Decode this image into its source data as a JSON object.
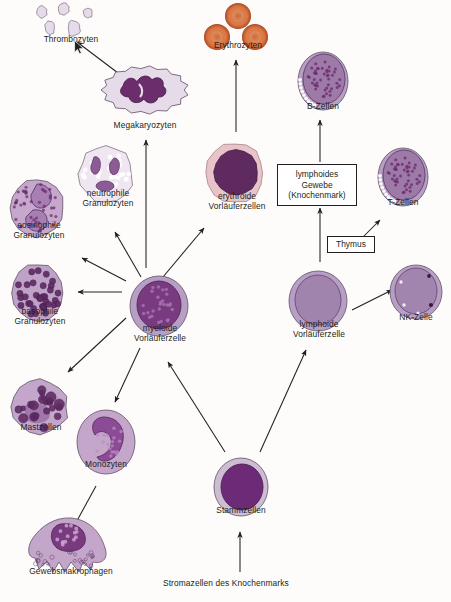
{
  "diagram": {
    "background_color": "#fdfcfa",
    "text_color": "#231f20",
    "arrow_color": "#231f20",
    "palette": {
      "erythrocyte": "#d9713d",
      "erythrocyte_dark": "#b0522a",
      "lymph_cytoplasm": "#b79ec4",
      "nucleus_dark": "#6b2d6b",
      "nucleus_mid": "#8c5b96",
      "pale_cytoplasm": "#e6dbe8",
      "pink_cytoplasm": "#e8c3c8",
      "stem_nucleus": "#6d2b77"
    },
    "nodes": [
      {
        "id": "thrombozyten",
        "label": "Thrombozyten",
        "kind": "platelets",
        "x": 28,
        "y": 2,
        "w": 86,
        "h": 44,
        "label_y": 32
      },
      {
        "id": "erythrozyten",
        "label": "Erythrozyten",
        "kind": "erythrocytes",
        "x": 193,
        "y": 2,
        "w": 90,
        "h": 50,
        "label_y": 38
      },
      {
        "id": "megakaryozyten",
        "label": "Megakaryozyten",
        "kind": "megakaryocyte",
        "x": 99,
        "y": 64,
        "w": 92,
        "h": 70,
        "label_y": 56
      },
      {
        "id": "b-zellen",
        "label": "B-Zellen",
        "kind": "lymphocyte-speckled",
        "x": 292,
        "y": 47,
        "w": 62,
        "h": 70,
        "label_y": 54
      },
      {
        "id": "neutrophile-granulozyten",
        "label": "neutrophile\nGranulozyten",
        "kind": "neutrophil",
        "x": 72,
        "y": 140,
        "w": 72,
        "h": 74,
        "label_y": 48
      },
      {
        "id": "erythroide-vorlaeuferzellen",
        "label": "erythroide\nVorläuferzellen",
        "kind": "erythroid-precursor",
        "x": 199,
        "y": 135,
        "w": 76,
        "h": 80,
        "label_y": 56
      },
      {
        "id": "t-zellen",
        "label": "T-Zellen",
        "kind": "lymphocyte-speckled",
        "x": 372,
        "y": 143,
        "w": 62,
        "h": 70,
        "label_y": 54
      },
      {
        "id": "eosinophile-granulozyten",
        "label": "eosinophile\nGranulozyten",
        "kind": "eosinophil",
        "x": 3,
        "y": 172,
        "w": 72,
        "h": 76,
        "label_y": 48
      },
      {
        "id": "basophile-granulozyten",
        "label": "basophile\nGranulozyten",
        "kind": "basophil",
        "x": 5,
        "y": 258,
        "w": 70,
        "h": 76,
        "label_y": 48
      },
      {
        "id": "myeloide-vorlaeuferzelle",
        "label": "myeloide\nVorläuferzelle",
        "kind": "progenitor",
        "x": 124,
        "y": 271,
        "w": 72,
        "h": 76,
        "label_y": 52
      },
      {
        "id": "lymphoide-vorlaeuferzelle",
        "label": "lymphoide\nVorläuferzelle",
        "kind": "progenitor-light",
        "x": 283,
        "y": 265,
        "w": 72,
        "h": 78,
        "label_y": 54
      },
      {
        "id": "nk-zelle",
        "label": "NK-Zelle",
        "kind": "nk-cell",
        "x": 385,
        "y": 258,
        "w": 62,
        "h": 70,
        "label_y": 54
      },
      {
        "id": "mastzellen",
        "label": "Mastzellen",
        "kind": "mast-cell",
        "x": 6,
        "y": 374,
        "w": 70,
        "h": 70,
        "label_y": 48
      },
      {
        "id": "monozyten",
        "label": "Monozyten",
        "kind": "monocyte",
        "x": 73,
        "y": 405,
        "w": 66,
        "h": 76,
        "label_y": 54
      },
      {
        "id": "stammzellen",
        "label": "Stammzellen",
        "kind": "stem-cell",
        "x": 208,
        "y": 451,
        "w": 66,
        "h": 76,
        "label_y": 54
      },
      {
        "id": "gewebsmakrophagen",
        "label": "Gewebsmakrophagen",
        "kind": "macrophage",
        "x": 21,
        "y": 512,
        "w": 100,
        "h": 72,
        "label_y": 54
      }
    ],
    "boxes": [
      {
        "id": "lymphoides-gewebe",
        "label": "lymphoides\nGewebe\n(Knochenmark)",
        "x": 277,
        "y": 164,
        "w": 80,
        "h": 42
      },
      {
        "id": "thymus",
        "label": "Thymus",
        "x": 327,
        "y": 236,
        "w": 48,
        "h": 17
      }
    ],
    "caption": {
      "id": "stromazellen",
      "label": "Stromazellen des Knochenmarks",
      "x": 163,
      "y": 578
    },
    "arrows": [
      {
        "id": "megakaryozyten-to-thrombozyten",
        "x1": 122,
        "y1": 76,
        "x2": 77,
        "y2": 42
      },
      {
        "id": "myeloid-to-megakaryozyten",
        "x1": 146,
        "y1": 268,
        "x2": 146,
        "y2": 140
      },
      {
        "id": "erythroid-to-erythrozyten",
        "x1": 236,
        "y1": 132,
        "x2": 236,
        "y2": 60
      },
      {
        "id": "lymphgewebe-to-bzellen",
        "x1": 320,
        "y1": 162,
        "x2": 320,
        "y2": 120
      },
      {
        "id": "lymphoid-to-lymphgewebe",
        "x1": 320,
        "y1": 262,
        "x2": 320,
        "y2": 208
      },
      {
        "id": "myeloid-to-neutrophil",
        "x1": 141,
        "y1": 277,
        "x2": 115,
        "y2": 232
      },
      {
        "id": "myeloid-to-eosinophil",
        "x1": 126,
        "y1": 281,
        "x2": 82,
        "y2": 258
      },
      {
        "id": "myeloid-to-basophil",
        "x1": 122,
        "y1": 292,
        "x2": 78,
        "y2": 292
      },
      {
        "id": "myeloid-to-erythroid",
        "x1": 163,
        "y1": 277,
        "x2": 204,
        "y2": 228
      },
      {
        "id": "myeloid-to-mastzellen",
        "x1": 126,
        "y1": 318,
        "x2": 68,
        "y2": 372
      },
      {
        "id": "myeloid-to-monozyten",
        "x1": 140,
        "y1": 348,
        "x2": 115,
        "y2": 402
      },
      {
        "id": "monozyten-to-makrophagen",
        "x1": 96,
        "y1": 486,
        "x2": 73,
        "y2": 528
      },
      {
        "id": "stamm-to-myeloid",
        "x1": 225,
        "y1": 452,
        "x2": 168,
        "y2": 362
      },
      {
        "id": "stamm-to-lymphoid",
        "x1": 260,
        "y1": 452,
        "x2": 306,
        "y2": 350
      },
      {
        "id": "thymus-to-tzellen",
        "x1": 348,
        "y1": 252,
        "x2": 380,
        "y2": 220
      },
      {
        "id": "lymphoid-to-nk",
        "x1": 352,
        "y1": 310,
        "x2": 392,
        "y2": 290
      },
      {
        "id": "stroma-to-stammzellen",
        "x1": 240,
        "y1": 572,
        "x2": 240,
        "y2": 532
      }
    ],
    "cursor": {
      "id": "mouse-pointer",
      "x": 74,
      "y": 40
    }
  }
}
